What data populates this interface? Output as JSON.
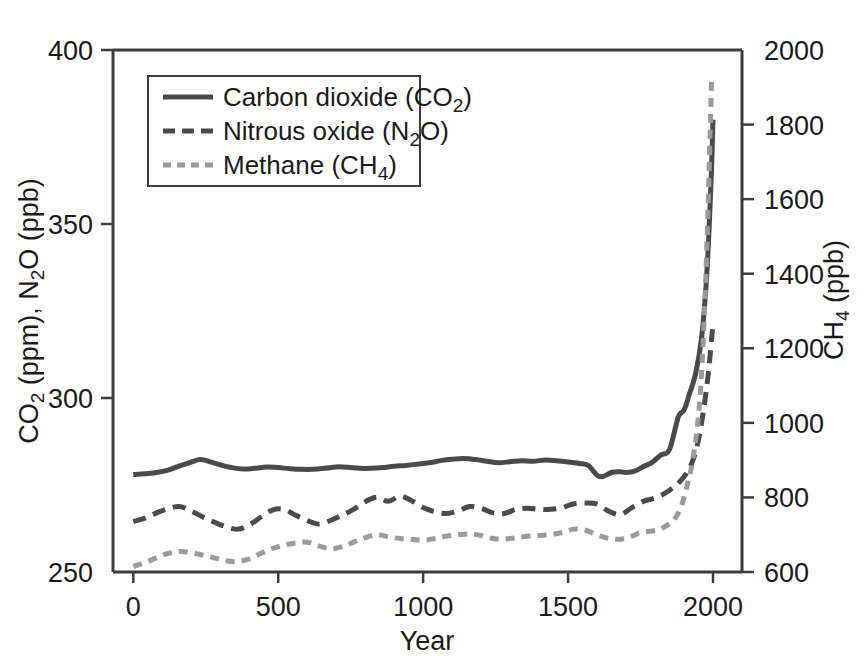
{
  "chart_data": {
    "type": "line",
    "title": "",
    "xlabel": "Year",
    "ylabel_left": "CO2 (ppm), N2O (ppb)",
    "ylabel_right": "CH4 (ppb)",
    "xlim": [
      -70,
      2100
    ],
    "ylim_left": [
      250,
      400
    ],
    "ylim_right": [
      600,
      2000
    ],
    "grid": false,
    "legend_position": "top-left-inside",
    "xticks": [
      0,
      500,
      1000,
      1500,
      2000
    ],
    "xtick_labels": [
      "0",
      "500",
      "1000",
      "1500",
      "2000"
    ],
    "yticks_left": [
      250,
      300,
      350,
      400
    ],
    "ytick_labels_left": [
      "250",
      "300",
      "350",
      "400"
    ],
    "yticks_right": [
      600,
      800,
      1000,
      1200,
      1400,
      1600,
      1800,
      2000
    ],
    "ytick_labels_right": [
      "600",
      "800",
      "1000",
      "1200",
      "1400",
      "1600",
      "1800",
      "2000"
    ],
    "series": [
      {
        "name": "Carbon dioxide (CO2)",
        "legend_label_main": "Carbon dioxide (CO",
        "legend_label_sub": "2",
        "legend_label_tail": ")",
        "axis": "left",
        "style": "solid",
        "color": "#4a4a4a",
        "width": 5,
        "x": [
          0,
          40,
          80,
          120,
          160,
          200,
          230,
          260,
          300,
          340,
          380,
          420,
          460,
          500,
          540,
          580,
          620,
          660,
          700,
          740,
          780,
          820,
          860,
          900,
          940,
          980,
          1020,
          1060,
          1100,
          1140,
          1180,
          1220,
          1260,
          1300,
          1340,
          1380,
          1420,
          1460,
          1500,
          1540,
          1570,
          1600,
          1620,
          1650,
          1680,
          1700,
          1730,
          1760,
          1790,
          1820,
          1850,
          1880,
          1900,
          1920,
          1940,
          1960,
          1975,
          1985,
          1995,
          2000
        ],
        "y": [
          278.0,
          278.2,
          278.6,
          279.3,
          280.5,
          281.6,
          282.3,
          281.8,
          280.8,
          280.0,
          279.6,
          279.8,
          280.2,
          280.0,
          279.7,
          279.5,
          279.5,
          279.8,
          280.2,
          280.1,
          279.8,
          279.8,
          280.0,
          280.4,
          280.6,
          281.0,
          281.4,
          282.0,
          282.4,
          282.6,
          282.3,
          281.8,
          281.4,
          281.7,
          282.0,
          281.8,
          282.2,
          282.0,
          281.6,
          281.2,
          280.6,
          277.8,
          277.4,
          278.6,
          278.8,
          278.6,
          279.0,
          280.3,
          281.5,
          283.6,
          285.2,
          294.5,
          296.5,
          301.5,
          307.0,
          317.0,
          331.0,
          346.0,
          366.0,
          380.0
        ]
      },
      {
        "name": "Nitrous oxide (N2O)",
        "legend_label_main": "Nitrous oxide (N",
        "legend_label_sub": "2",
        "legend_label_tail": "O)",
        "axis": "left",
        "style": "dashed",
        "color": "#4a4a4a",
        "width": 5,
        "dasharray": "13,8",
        "x": [
          0,
          40,
          80,
          120,
          160,
          200,
          240,
          280,
          320,
          360,
          400,
          440,
          480,
          520,
          560,
          600,
          640,
          680,
          720,
          760,
          800,
          840,
          880,
          920,
          960,
          1000,
          1040,
          1080,
          1120,
          1160,
          1200,
          1240,
          1280,
          1320,
          1360,
          1400,
          1440,
          1480,
          1520,
          1560,
          1600,
          1640,
          1680,
          1720,
          1760,
          1790,
          1820,
          1850,
          1880,
          1910,
          1930,
          1950,
          1970,
          1985,
          1995,
          2000
        ],
        "y": [
          264.5,
          265.5,
          267.0,
          268.2,
          268.8,
          267.5,
          265.8,
          264.3,
          263.0,
          262.3,
          263.5,
          265.8,
          267.8,
          268.0,
          266.3,
          264.8,
          263.8,
          264.8,
          266.3,
          268.0,
          270.2,
          271.5,
          270.3,
          271.8,
          270.5,
          268.5,
          267.3,
          266.8,
          267.5,
          268.8,
          268.3,
          267.0,
          266.8,
          268.0,
          268.3,
          268.0,
          268.0,
          268.5,
          269.6,
          269.8,
          269.5,
          267.5,
          266.5,
          268.5,
          270.3,
          271.0,
          272.0,
          273.5,
          275.5,
          278.5,
          282.0,
          288.0,
          298.0,
          308.0,
          317.0,
          321.0
        ]
      },
      {
        "name": "Methane (CH4)",
        "legend_label_main": "Methane (CH",
        "legend_label_sub": "4",
        "legend_label_tail": ")",
        "axis": "right",
        "style": "dotted",
        "color": "#9a9a9a",
        "width": 5,
        "dasharray": "9,7",
        "x": [
          0,
          40,
          80,
          120,
          160,
          200,
          240,
          280,
          320,
          360,
          400,
          440,
          480,
          520,
          560,
          600,
          640,
          680,
          720,
          760,
          800,
          840,
          880,
          920,
          960,
          1000,
          1040,
          1080,
          1120,
          1160,
          1200,
          1240,
          1280,
          1320,
          1360,
          1400,
          1440,
          1480,
          1520,
          1560,
          1600,
          1640,
          1680,
          1720,
          1750,
          1790,
          1820,
          1850,
          1870,
          1890,
          1910,
          1930,
          1950,
          1965,
          1980,
          1990,
          1995
        ],
        "y": [
          615,
          625,
          638,
          650,
          655,
          652,
          645,
          638,
          630,
          628,
          635,
          650,
          663,
          672,
          678,
          680,
          670,
          662,
          668,
          680,
          692,
          700,
          694,
          690,
          688,
          685,
          690,
          696,
          700,
          702,
          698,
          690,
          688,
          692,
          696,
          698,
          700,
          706,
          715,
          712,
          700,
          690,
          688,
          696,
          706,
          710,
          716,
          730,
          745,
          775,
          830,
          900,
          1020,
          1200,
          1500,
          1780,
          1920
        ]
      }
    ]
  },
  "axis": {
    "x_title": "Year",
    "y_left_title_parts": [
      "CO",
      "2",
      " (ppm), N",
      "2",
      "O (ppb)"
    ],
    "y_right_title_parts": [
      "CH",
      "4",
      " (ppb)"
    ]
  },
  "legend": {
    "items": [
      {
        "label": "Carbon dioxide (CO2)"
      },
      {
        "label": "Nitrous oxide (N2O)"
      },
      {
        "label": "Methane (CH4)"
      }
    ]
  },
  "colors": {
    "co2": "#4a4a4a",
    "n2o": "#4a4a4a",
    "ch4": "#9a9a9a",
    "frame": "#3c3c3c",
    "text": "#1a1a1a",
    "background": "#ffffff"
  }
}
